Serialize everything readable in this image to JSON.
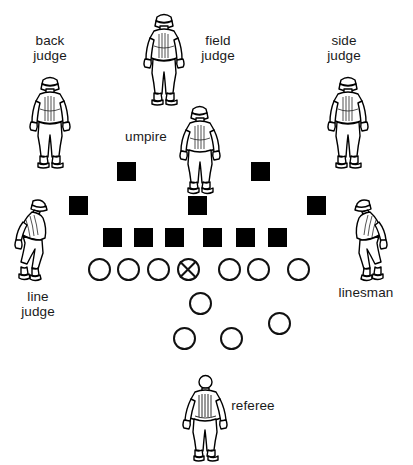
{
  "diagram": {
    "width": 413,
    "height": 465,
    "background_color": "#ffffff",
    "ink_color": "#000000"
  },
  "officials": [
    {
      "id": "back-judge",
      "label": "back\njudge",
      "pose": "standing-front",
      "label_x": 22,
      "label_y": 33,
      "fig_x": 22,
      "fig_y": 73,
      "fig_w": 56,
      "fig_h": 96
    },
    {
      "id": "field-judge",
      "label": "field\njudge",
      "pose": "standing-front",
      "label_x": 190,
      "label_y": 33,
      "fig_x": 136,
      "fig_y": 10,
      "fig_w": 56,
      "fig_h": 96
    },
    {
      "id": "side-judge",
      "label": "side\njudge",
      "pose": "standing-front",
      "label_x": 316,
      "label_y": 33,
      "fig_x": 320,
      "fig_y": 73,
      "fig_w": 56,
      "fig_h": 96
    },
    {
      "id": "umpire",
      "label": "umpire",
      "pose": "standing-front",
      "label_x": 122,
      "label_y": 129,
      "fig_x": 173,
      "fig_y": 103,
      "fig_w": 54,
      "fig_h": 92
    },
    {
      "id": "line-judge",
      "label": "line\njudge",
      "pose": "crouching-left",
      "label_x": 16,
      "label_y": 289,
      "fig_x": 8,
      "fig_y": 196,
      "fig_w": 50,
      "fig_h": 88
    },
    {
      "id": "linesman",
      "label": "linesman",
      "pose": "crouching-right",
      "label_x": 331,
      "label_y": 285,
      "fig_x": 344,
      "fig_y": 196,
      "fig_w": 50,
      "fig_h": 88
    },
    {
      "id": "referee",
      "label": "referee",
      "pose": "standing-back",
      "label_x": 224,
      "label_y": 398,
      "fig_x": 178,
      "fig_y": 372,
      "fig_w": 54,
      "fig_h": 90
    }
  ],
  "defense_markers": {
    "shape": "square",
    "color": "#000000",
    "rows": [
      {
        "row": "deep-backs",
        "size": 19,
        "y": 162,
        "x": [
          117,
          251
        ]
      },
      {
        "row": "linebackers",
        "size": 19,
        "y": 196,
        "x": [
          69,
          188,
          307
        ]
      },
      {
        "row": "defensive-line",
        "size": 19,
        "y": 228,
        "x": [
          103,
          133,
          163,
          203,
          235,
          268
        ]
      }
    ]
  },
  "offense_markers": {
    "shape": "circle",
    "outline_color": "#111111",
    "rows": [
      {
        "row": "offensive-line",
        "size": 22,
        "y": 258,
        "x": [
          88,
          116,
          146,
          176,
          217,
          246,
          287
        ],
        "ball_carrier_index": 3
      },
      {
        "row": "quarterback",
        "size": 22,
        "y": 292,
        "x": [
          189
        ]
      },
      {
        "row": "flanker",
        "size": 22,
        "y": 312,
        "x": [
          268
        ]
      },
      {
        "row": "backfield",
        "size": 22,
        "y": 327,
        "x": [
          173,
          220
        ]
      }
    ]
  }
}
